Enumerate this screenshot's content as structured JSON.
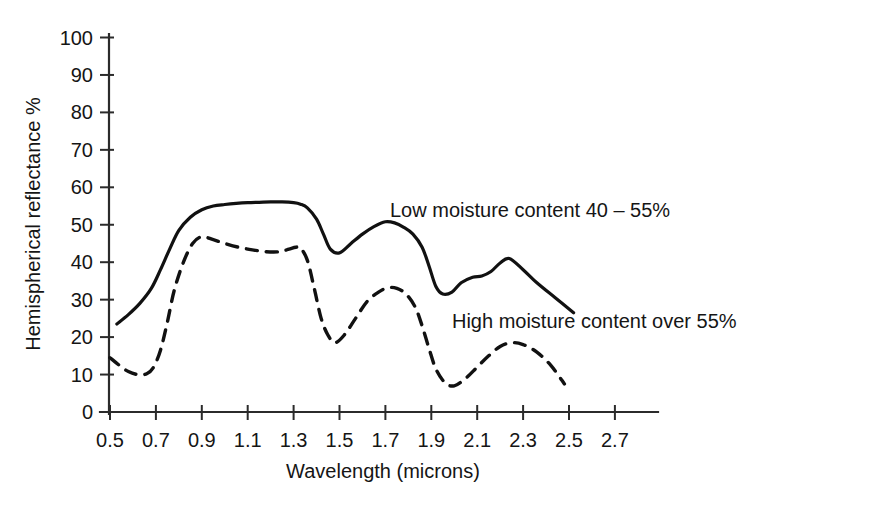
{
  "chart_data": {
    "type": "line",
    "title": "",
    "xlabel": "Wavelength (microns)",
    "ylabel": "Hemispherical reflectance %",
    "xlim": [
      0.4,
      2.9
    ],
    "ylim": [
      0,
      100
    ],
    "grid": false,
    "legend_position": "inline-annotation",
    "x_ticks": [
      "0.5",
      "0.7",
      "0.9",
      "1.1",
      "1.3",
      "1.5",
      "1.7",
      "1.9",
      "2.1",
      "2.3",
      "2.5",
      "2.7"
    ],
    "x_tick_values": [
      0.5,
      0.7,
      0.9,
      1.1,
      1.3,
      1.5,
      1.7,
      1.9,
      2.1,
      2.3,
      2.5,
      2.7
    ],
    "y_ticks": [
      "0",
      "10",
      "20",
      "30",
      "40",
      "50",
      "60",
      "70",
      "80",
      "90",
      "100"
    ],
    "y_tick_values": [
      0,
      10,
      20,
      30,
      40,
      50,
      60,
      70,
      80,
      90,
      100
    ],
    "series": [
      {
        "name": "Low moisture content 40 – 55%",
        "style": "solid",
        "color": "#111111",
        "annotation": "Low moisture content 40 – 55%",
        "annotation_x": 1.72,
        "annotation_y": 52,
        "x": [
          0.53,
          0.58,
          0.63,
          0.68,
          0.72,
          0.76,
          0.8,
          0.85,
          0.9,
          0.95,
          1.0,
          1.05,
          1.1,
          1.15,
          1.2,
          1.25,
          1.3,
          1.33,
          1.36,
          1.4,
          1.43,
          1.46,
          1.5,
          1.55,
          1.6,
          1.65,
          1.7,
          1.74,
          1.78,
          1.82,
          1.86,
          1.89,
          1.92,
          1.95,
          1.99,
          2.03,
          2.08,
          2.12,
          2.16,
          2.2,
          2.24,
          2.3,
          2.36,
          2.44,
          2.52
        ],
        "y": [
          23.5,
          26.0,
          29.0,
          33.0,
          38.0,
          43.5,
          48.5,
          52.0,
          54.0,
          55.0,
          55.4,
          55.7,
          55.9,
          56.0,
          56.1,
          56.1,
          55.9,
          55.5,
          54.5,
          51.5,
          47.5,
          43.5,
          42.5,
          45.0,
          47.5,
          49.5,
          50.8,
          50.5,
          49.3,
          47.5,
          44.0,
          39.0,
          33.5,
          31.5,
          32.0,
          34.5,
          36.0,
          36.3,
          37.5,
          39.8,
          41.0,
          38.0,
          34.5,
          30.5,
          26.5
        ]
      },
      {
        "name": "High moisture content over 55%",
        "style": "dashed",
        "color": "#111111",
        "annotation": "High moisture content over 55%",
        "annotation_x": 1.99,
        "annotation_y": 22.5,
        "x": [
          0.5,
          0.54,
          0.58,
          0.62,
          0.66,
          0.69,
          0.72,
          0.75,
          0.78,
          0.82,
          0.86,
          0.9,
          0.95,
          1.0,
          1.06,
          1.12,
          1.18,
          1.24,
          1.28,
          1.31,
          1.33,
          1.36,
          1.39,
          1.42,
          1.45,
          1.48,
          1.52,
          1.57,
          1.62,
          1.67,
          1.71,
          1.75,
          1.79,
          1.83,
          1.86,
          1.89,
          1.92,
          1.96,
          2.0,
          2.05,
          2.1,
          2.15,
          2.2,
          2.25,
          2.3,
          2.36,
          2.42,
          2.48
        ],
        "y": [
          14.5,
          12.5,
          10.8,
          10.0,
          10.2,
          12.0,
          16.5,
          24.0,
          32.5,
          40.0,
          45.0,
          46.8,
          46.0,
          45.0,
          44.0,
          43.3,
          42.8,
          42.8,
          43.5,
          44.0,
          43.8,
          40.5,
          33.0,
          25.0,
          20.5,
          18.5,
          20.5,
          25.0,
          29.5,
          32.0,
          33.2,
          33.0,
          31.5,
          28.0,
          23.0,
          17.0,
          11.5,
          7.8,
          7.0,
          9.0,
          12.0,
          15.0,
          17.5,
          18.5,
          18.0,
          16.0,
          12.5,
          7.5
        ]
      }
    ]
  },
  "axis": {
    "x_title": "Wavelength (microns)",
    "y_title": "Hemispherical reflectance %"
  }
}
